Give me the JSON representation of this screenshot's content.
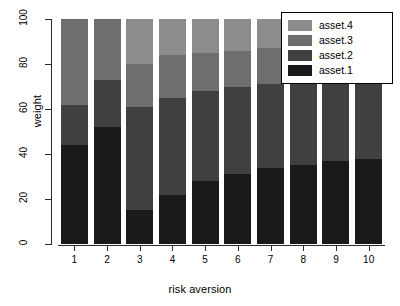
{
  "chart_data": {
    "type": "bar",
    "stacked": true,
    "title": "",
    "xlabel": "risk aversion",
    "ylabel": "weight",
    "categories": [
      "1",
      "2",
      "3",
      "4",
      "5",
      "6",
      "7",
      "8",
      "9",
      "10"
    ],
    "ylim": [
      0,
      100
    ],
    "yticks": [
      0,
      20,
      40,
      60,
      80,
      100
    ],
    "grid": false,
    "legend_position": "top-right",
    "series": [
      {
        "name": "asset.1",
        "color": "#1a1a1a",
        "values": [
          44,
          52,
          15,
          22,
          28,
          31,
          34,
          35,
          37,
          38
        ]
      },
      {
        "name": "asset.2",
        "color": "#404040",
        "values": [
          18,
          21,
          46,
          43,
          40,
          39,
          37,
          38,
          36,
          36
        ]
      },
      {
        "name": "asset.3",
        "color": "#6e6e6e",
        "values": [
          38,
          27,
          19,
          19,
          17,
          16,
          16,
          12,
          11,
          10
        ]
      },
      {
        "name": "asset.4",
        "color": "#8c8c8c",
        "values": [
          0,
          0,
          20,
          16,
          15,
          14,
          13,
          15,
          16,
          16
        ]
      }
    ],
    "legend_entries": [
      {
        "label": "asset.4",
        "color": "#8c8c8c"
      },
      {
        "label": "asset.3",
        "color": "#6e6e6e"
      },
      {
        "label": "asset.2",
        "color": "#404040"
      },
      {
        "label": "asset.1",
        "color": "#1a1a1a"
      }
    ]
  }
}
